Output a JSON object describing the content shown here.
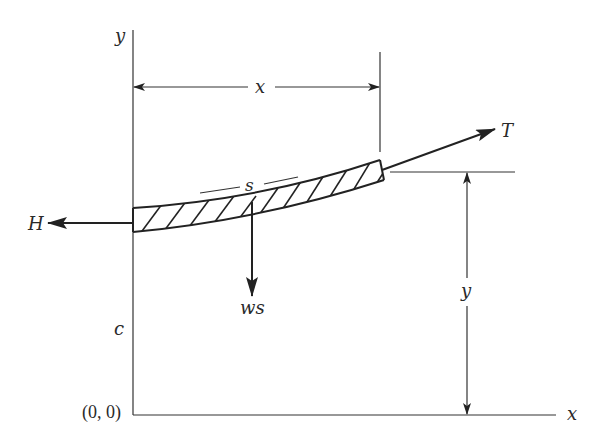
{
  "figure": {
    "type": "free-body diagram of a cable segment (catenary)",
    "background": "#ffffff",
    "line_color": "#333333"
  },
  "labels": {
    "y_axis": "y",
    "x_axis": "x",
    "origin": "(0, 0)",
    "c_offset": "c",
    "horizontal_tension": "H",
    "tension": "T",
    "weight": "ws",
    "arc_length": "s",
    "dim_x": "x",
    "dim_y": "y"
  },
  "elements": {
    "axes": {
      "origin_px": [
        133,
        415
      ],
      "y_axis_top_px": 30,
      "x_axis_right_px": 556
    },
    "cable_segment": {
      "left_x": 133,
      "right_x": 382,
      "hatched": true
    },
    "force_H": {
      "direction": "left",
      "label": "H"
    },
    "force_T": {
      "direction": "up-right, tangent to cable",
      "label": "T"
    },
    "force_ws": {
      "direction": "down",
      "label": "ws"
    },
    "dimension_x": {
      "from": "y-axis",
      "to": "segment right end",
      "label": "x"
    },
    "dimension_y": {
      "from": "x-axis",
      "to": "segment right end height",
      "label": "y"
    }
  }
}
